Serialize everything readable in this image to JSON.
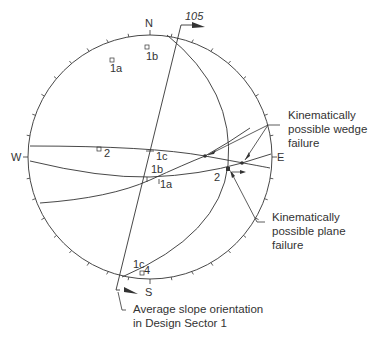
{
  "diagram": {
    "type": "stereonet",
    "colors": {
      "ink": "#333333",
      "background": "#ffffff"
    },
    "net": {
      "cx": 150,
      "cy": 157,
      "r": 122
    },
    "directions": {
      "north": "N",
      "east": "E",
      "south": "S",
      "west": "W"
    },
    "slope": {
      "dip_direction_label": "105"
    },
    "poles": [
      {
        "label": "1a"
      },
      {
        "label": "1b"
      },
      {
        "label": "2"
      },
      {
        "label": "4"
      }
    ],
    "great_circle_labels": {
      "1c": "1c",
      "1b": "1b",
      "1a": "1a",
      "2": "2",
      "1c_bottom": "1c"
    },
    "annotations": {
      "wedge": {
        "line1": "Kinematically",
        "line2": "possible wedge",
        "line3": "failure"
      },
      "plane": {
        "line1": "Kinematically",
        "line2": "possible plane",
        "line3": "failure"
      },
      "slope": {
        "line1": "Average slope orientation",
        "line2": "in Design Sector 1"
      }
    }
  }
}
